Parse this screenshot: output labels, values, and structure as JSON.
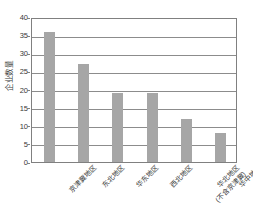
{
  "chart_data": {
    "type": "bar",
    "title": "",
    "xlabel": "",
    "ylabel": "企业数量",
    "ylim": [
      0,
      40
    ],
    "yticks": [
      0,
      5,
      10,
      15,
      20,
      25,
      30,
      35,
      40
    ],
    "grid": true,
    "legend": null,
    "bar_color": "#a6a6a6",
    "axis_color": "#808080",
    "categories": [
      "京津冀地区",
      "东北地区",
      "华东地区",
      "西北地区",
      "华北地区(不含京津冀)",
      "华中地区"
    ],
    "category_lines": [
      [
        "京津冀地区"
      ],
      [
        "东北地区"
      ],
      [
        "华东地区"
      ],
      [
        "西北地区"
      ],
      [
        "华北地区",
        "(不含京津冀)"
      ],
      [
        "华中地区"
      ]
    ],
    "values": [
      36,
      27,
      19,
      19,
      12,
      8
    ],
    "series": [
      {
        "name": "企业数量",
        "values": [
          36,
          27,
          19,
          19,
          12,
          8
        ]
      }
    ]
  }
}
